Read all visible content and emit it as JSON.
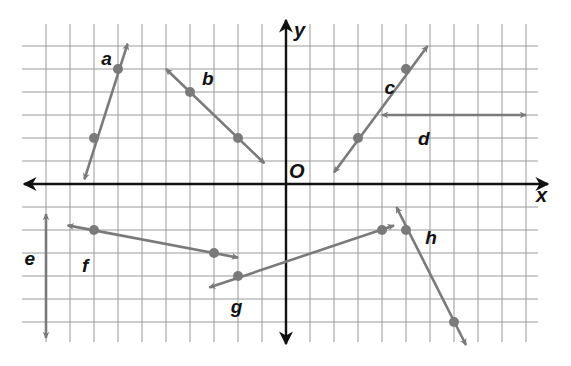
{
  "diagram": {
    "grid": {
      "x_min": -10,
      "x_max": 10,
      "y_min": -6,
      "y_max": 6,
      "origin_px": [
        286,
        184
      ],
      "unit_px_x": 24,
      "unit_px_y": 23,
      "grid_color": "#9a9a9a",
      "axis_color": "#111111",
      "line_color": "#7a7a7a"
    },
    "axes": {
      "x_label": "x",
      "y_label": "y",
      "origin_label": "O"
    },
    "lines": [
      {
        "name": "a",
        "label": "a",
        "points": [
          [
            -8,
            2
          ],
          [
            -7,
            5
          ]
        ],
        "from": [
          -8.4,
          0.2
        ],
        "to": [
          -6.6,
          6.1
        ],
        "label_pos": [
          -7.7,
          5.5
        ]
      },
      {
        "name": "b",
        "label": "b",
        "points": [
          [
            -4,
            4
          ],
          [
            -2,
            2
          ]
        ],
        "from": [
          -5.0,
          5.0
        ],
        "to": [
          -0.9,
          0.9
        ],
        "label_pos": [
          -3.5,
          4.6
        ]
      },
      {
        "name": "c",
        "label": "c",
        "points": [
          [
            3,
            2
          ],
          [
            5,
            5
          ]
        ],
        "from": [
          2.0,
          0.5
        ],
        "to": [
          5.9,
          6.0
        ],
        "label_pos": [
          4.1,
          4.2
        ]
      },
      {
        "name": "d",
        "label": "d",
        "points": [],
        "from": [
          4.0,
          3.0
        ],
        "to": [
          10.0,
          3.0
        ],
        "label_pos": [
          5.5,
          2.0
        ]
      },
      {
        "name": "e",
        "label": "e",
        "points": [],
        "from": [
          -10.0,
          -1.3
        ],
        "to": [
          -10.0,
          -6.7
        ],
        "label_pos": [
          -10.9,
          -3.2
        ]
      },
      {
        "name": "f",
        "label": "f",
        "points": [
          [
            -8,
            -2
          ],
          [
            -3,
            -3
          ]
        ],
        "from": [
          -9.1,
          -1.8
        ],
        "to": [
          -2.0,
          -3.2
        ],
        "label_pos": [
          -8.5,
          -3.5
        ]
      },
      {
        "name": "g",
        "label": "g",
        "points": [
          [
            -2,
            -4
          ],
          [
            4,
            -2
          ]
        ],
        "from": [
          -3.2,
          -4.5
        ],
        "to": [
          4.5,
          -1.8
        ],
        "label_pos": [
          -2.3,
          -5.3
        ]
      },
      {
        "name": "h",
        "label": "h",
        "points": [
          [
            5,
            -2
          ],
          [
            7,
            -6
          ]
        ],
        "from": [
          4.6,
          -1.0
        ],
        "to": [
          7.5,
          -7.0
        ],
        "label_pos": [
          5.8,
          -2.3
        ]
      }
    ]
  }
}
